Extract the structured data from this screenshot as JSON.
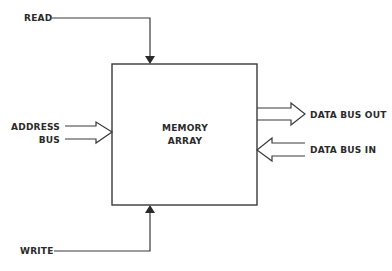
{
  "diagram": {
    "block": {
      "line1": "MEMORY",
      "line2": "ARRAY"
    },
    "signals": {
      "read": "READ",
      "write": "WRITE",
      "address_line1": "ADDRESS",
      "address_line2": "BUS",
      "data_out": "DATA BUS OUT",
      "data_in": "DATA BUS IN"
    },
    "colors": {
      "stroke": "#3a3a3a",
      "text": "#2a2a2a",
      "background": "#ffffff"
    }
  }
}
